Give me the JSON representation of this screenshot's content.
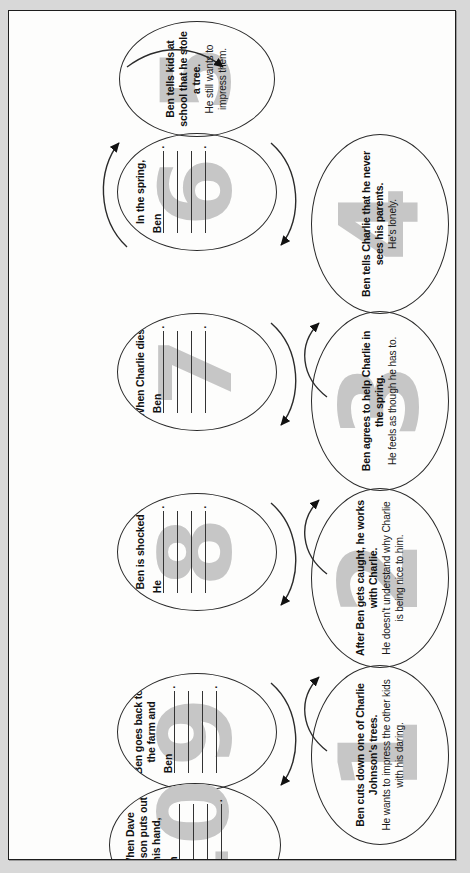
{
  "page": {
    "background_color": "#d8d8d8",
    "sheet_color": "#fdfdfc",
    "border_color": "#1d1d1d",
    "watermark_color": "#c6c6c6",
    "orientation": "rotated-90-ccw"
  },
  "diagram": {
    "type": "flowchart-cycle",
    "shape": "oval",
    "connector": "curved-arrow",
    "node_count": 10,
    "nodes": [
      {
        "number": "1",
        "lead": "Ben cuts down one of Charlie Johnson's trees.",
        "sub": "He wants to impress the other kids with his daring.",
        "blanks": [],
        "prefill": []
      },
      {
        "number": "2",
        "lead": "After Ben gets caught, he works with Charlie.",
        "sub": "He doesn't understand why Charlie is being nice to him.",
        "blanks": [],
        "prefill": []
      },
      {
        "number": "3",
        "lead": "Ben agrees to help Charlie in the spring.",
        "sub": "He feels as though he has to.",
        "blanks": [],
        "prefill": []
      },
      {
        "number": "4",
        "lead": "Ben tells Charlie that he never sees his parents.",
        "sub": "He's lonely.",
        "blanks": [],
        "prefill": []
      },
      {
        "number": "5",
        "lead": "Ben tells kids at school that he stole a tree.",
        "sub": "He still wants to impress them.",
        "blanks": [],
        "prefill": []
      },
      {
        "number": "6",
        "lead": "In the spring,",
        "sub": "",
        "blanks": [
          "",
          "",
          "",
          ""
        ],
        "prefill": [
          "Ben",
          "",
          "",
          ""
        ],
        "blank_dots": [
          true,
          false,
          false,
          true
        ]
      },
      {
        "number": "7",
        "lead": "When Charlie dies,",
        "sub": "",
        "blanks": [
          "",
          "",
          "",
          ""
        ],
        "prefill": [
          "Ben",
          "",
          "",
          ""
        ],
        "blank_dots": [
          true,
          false,
          false,
          true
        ]
      },
      {
        "number": "8",
        "lead": "Ben is shocked",
        "sub": "",
        "blanks": [
          "",
          "",
          "",
          ""
        ],
        "prefill": [
          "He",
          "",
          "",
          ""
        ],
        "blank_dots": [
          true,
          false,
          false,
          true
        ]
      },
      {
        "number": "9",
        "lead": "Ben goes back to the farm and",
        "sub": "",
        "blanks": [
          "",
          "",
          "",
          ""
        ],
        "prefill": [
          "Ben",
          "",
          "",
          ""
        ],
        "blank_dots": [
          true,
          false,
          false,
          true
        ]
      },
      {
        "number": "10",
        "lead": "When Dave Johnson puts out his hand,",
        "sub": "",
        "blanks": [
          "",
          "",
          "",
          ""
        ],
        "prefill": [
          "Ben",
          "",
          "",
          ""
        ],
        "blank_dots": [
          false,
          false,
          false,
          true
        ]
      }
    ]
  }
}
